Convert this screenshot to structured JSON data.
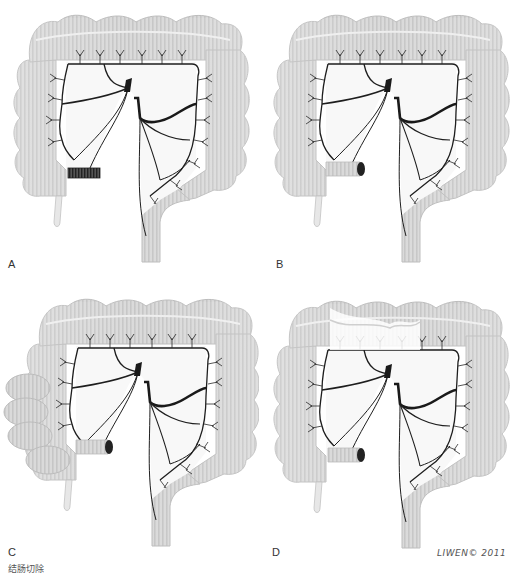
{
  "figure": {
    "type": "anatomical illustration",
    "colors": {
      "colon_fill": "#d9d9d9",
      "colon_stripe": "#c4c4c4",
      "colon_outline": "#bdbdbd",
      "vessel": "#1e1e1e",
      "mesentery": "#f7f7f7",
      "stump_dark": "#2a2a2a"
    }
  },
  "panels": [
    {
      "label": "A",
      "variant": "stapled ileal stump, full colon"
    },
    {
      "label": "B",
      "variant": "open ileal stump, full colon"
    },
    {
      "label": "C",
      "variant": "ileal stump with right colon loops"
    },
    {
      "label": "D",
      "variant": "ileal stump, transverse colon removed"
    }
  ],
  "signature": "LIWEN© 2011",
  "caption": "结肠切除"
}
